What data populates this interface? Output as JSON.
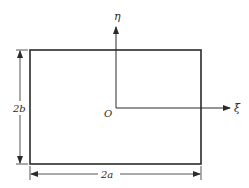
{
  "diagram": {
    "type": "rectangle-with-coordinate-axes",
    "colors": {
      "stroke": "#2a2a2a",
      "background": "#ffffff"
    },
    "rectangle": {
      "x": 30,
      "y": 50,
      "width": 171,
      "height": 114
    },
    "origin": {
      "label": "O",
      "x": 116,
      "y": 108
    },
    "axes": {
      "vertical": {
        "label": "η",
        "from_y": 108,
        "to_y": 27
      },
      "horizontal": {
        "label": "ξ",
        "from_x": 116,
        "to_x": 230
      }
    },
    "dimensions": {
      "height": {
        "label": "2b",
        "x": 20,
        "from_y": 50,
        "to_y": 164
      },
      "width": {
        "label": "2a",
        "y": 174,
        "from_x": 30,
        "to_x": 201
      }
    }
  }
}
